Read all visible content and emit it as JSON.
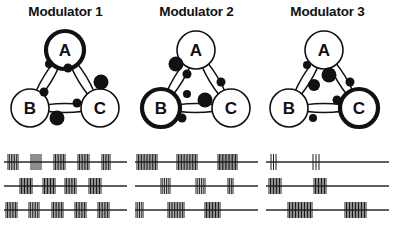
{
  "figure": {
    "panels": [
      {
        "title": "Modulator 1",
        "highlighted_node": "A",
        "nodes": [
          {
            "label": "A",
            "x": 65,
            "y": 30,
            "r": 19,
            "highlighted": true
          },
          {
            "label": "B",
            "x": 30,
            "y": 88,
            "r": 19,
            "highlighted": false
          },
          {
            "label": "C",
            "x": 100,
            "y": 88,
            "r": 19,
            "highlighted": false
          }
        ],
        "synapses": [
          {
            "from": "A",
            "to": "B",
            "x": 49,
            "y": 44,
            "r": 4.0
          },
          {
            "from": "B",
            "to": "A",
            "x": 44,
            "y": 72,
            "r": 4.5
          },
          {
            "from": "A",
            "to": "C",
            "x": 68,
            "y": 48,
            "r": 4.5
          },
          {
            "from": "C",
            "to": "A",
            "x": 101,
            "y": 62,
            "r": 7.5
          },
          {
            "from": "B",
            "to": "C",
            "x": 77,
            "y": 83,
            "r": 4.5
          },
          {
            "from": "C",
            "to": "B",
            "x": 57,
            "y": 98,
            "r": 7.5
          }
        ],
        "spike_rows": [
          {
            "neuron": "A",
            "bursts": [
              {
                "start": 4,
                "width": 10,
                "n": 7
              },
              {
                "start": 27,
                "width": 10,
                "n": 6
              },
              {
                "start": 50,
                "width": 11,
                "n": 8
              },
              {
                "start": 74,
                "width": 11,
                "n": 8
              },
              {
                "start": 98,
                "width": 8,
                "n": 6
              }
            ]
          },
          {
            "neuron": "B",
            "bursts": [
              {
                "start": 16,
                "width": 12,
                "n": 9
              },
              {
                "start": 39,
                "width": 12,
                "n": 9
              },
              {
                "start": 61,
                "width": 11,
                "n": 8
              },
              {
                "start": 85,
                "width": 12,
                "n": 9
              }
            ]
          },
          {
            "neuron": "C",
            "bursts": [
              {
                "start": 2,
                "width": 11,
                "n": 8
              },
              {
                "start": 25,
                "width": 10,
                "n": 7
              },
              {
                "start": 48,
                "width": 11,
                "n": 8
              },
              {
                "start": 71,
                "width": 11,
                "n": 8
              },
              {
                "start": 94,
                "width": 11,
                "n": 8
              }
            ]
          }
        ]
      },
      {
        "title": "Modulator 2",
        "highlighted_node": "B",
        "nodes": [
          {
            "label": "A",
            "x": 65,
            "y": 30,
            "r": 19,
            "highlighted": false
          },
          {
            "label": "B",
            "x": 30,
            "y": 88,
            "r": 19,
            "highlighted": true
          },
          {
            "label": "C",
            "x": 100,
            "y": 88,
            "r": 19,
            "highlighted": false
          }
        ],
        "synapses": [
          {
            "from": "A",
            "to": "B",
            "x": 45,
            "y": 44,
            "r": 7.5
          },
          {
            "from": "B",
            "to": "A",
            "x": 56,
            "y": 54,
            "r": 4.5
          },
          {
            "from": "A",
            "to": "C",
            "x": 90,
            "y": 62,
            "r": 4.5
          },
          {
            "from": "C",
            "to": "A",
            "x": 56,
            "y": 74,
            "r": 4.0
          },
          {
            "from": "B",
            "to": "C",
            "x": 74,
            "y": 80,
            "r": 7.5
          },
          {
            "from": "C",
            "to": "B",
            "x": 51,
            "y": 98,
            "r": 4.5
          }
        ],
        "spike_rows": [
          {
            "neuron": "A",
            "bursts": [
              {
                "start": 2,
                "width": 20,
                "n": 14
              },
              {
                "start": 42,
                "width": 20,
                "n": 14
              },
              {
                "start": 83,
                "width": 19,
                "n": 14
              }
            ]
          },
          {
            "neuron": "B",
            "bursts": [
              {
                "start": 26,
                "width": 9,
                "n": 6
              },
              {
                "start": 61,
                "width": 9,
                "n": 6
              },
              {
                "start": 93,
                "width": 5,
                "n": 4
              }
            ]
          },
          {
            "neuron": "C",
            "bursts": [
              {
                "start": 1,
                "width": 7,
                "n": 5
              },
              {
                "start": 33,
                "width": 16,
                "n": 11
              },
              {
                "start": 70,
                "width": 15,
                "n": 11
              }
            ]
          }
        ]
      },
      {
        "title": "Modulator 3",
        "highlighted_node": "C",
        "nodes": [
          {
            "label": "A",
            "x": 62,
            "y": 30,
            "r": 19,
            "highlighted": false
          },
          {
            "label": "B",
            "x": 27,
            "y": 88,
            "r": 19,
            "highlighted": false
          },
          {
            "label": "C",
            "x": 97,
            "y": 88,
            "r": 19,
            "highlighted": true
          }
        ],
        "synapses": [
          {
            "from": "A",
            "to": "B",
            "x": 45,
            "y": 45,
            "r": 4.0
          },
          {
            "from": "B",
            "to": "A",
            "x": 67,
            "y": 55,
            "r": 7.5
          },
          {
            "from": "A",
            "to": "C",
            "x": 88,
            "y": 62,
            "r": 4.5
          },
          {
            "from": "C",
            "to": "A",
            "x": 52,
            "y": 65,
            "r": 6.0
          },
          {
            "from": "B",
            "to": "C",
            "x": 75,
            "y": 80,
            "r": 4.5
          },
          {
            "from": "C",
            "to": "B",
            "x": 51,
            "y": 98,
            "r": 4.0
          }
        ],
        "spike_rows": [
          {
            "neuron": "A",
            "bursts": [
              {
                "start": 5,
                "width": 5,
                "n": 3
              },
              {
                "start": 47,
                "width": 6,
                "n": 3
              }
            ]
          },
          {
            "neuron": "B",
            "bursts": [
              {
                "start": 3,
                "width": 12,
                "n": 9
              },
              {
                "start": 48,
                "width": 12,
                "n": 9
              }
            ]
          },
          {
            "neuron": "C",
            "bursts": [
              {
                "start": 22,
                "width": 24,
                "n": 17
              },
              {
                "start": 79,
                "width": 21,
                "n": 15
              }
            ]
          }
        ]
      }
    ],
    "spike_row_y": [
      12,
      36,
      60
    ],
    "colors": {
      "ink": "#111111",
      "background": "#ffffff",
      "spike": "#1c1c1c",
      "axis": "#2a2a2a"
    }
  }
}
